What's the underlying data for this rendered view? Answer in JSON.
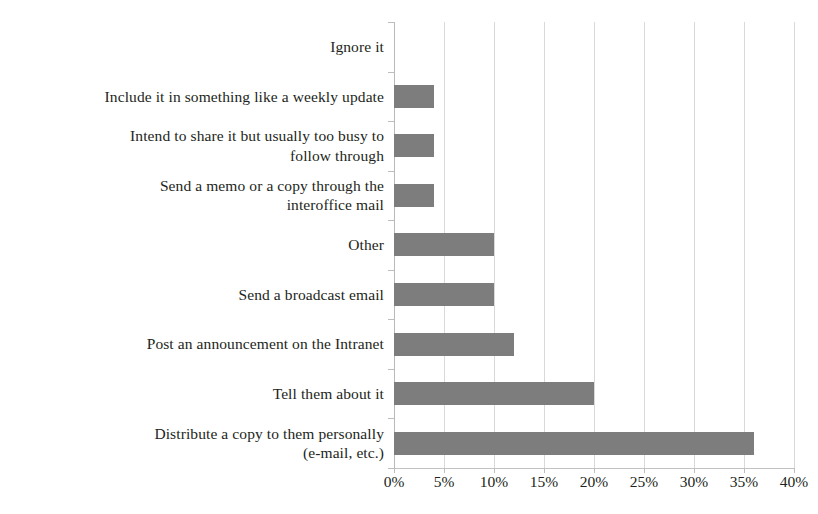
{
  "chart_data": {
    "type": "bar",
    "orientation": "horizontal",
    "title": "",
    "subtitle": "",
    "xlabel": "",
    "ylabel": "",
    "xlim": [
      0,
      40
    ],
    "xtick_step": 5,
    "xticks": [
      0,
      5,
      10,
      15,
      20,
      25,
      30,
      35,
      40
    ],
    "xtick_labels": [
      "0%",
      "5%",
      "10%",
      "15%",
      "20%",
      "25%",
      "30%",
      "35%",
      "40%"
    ],
    "grid": "vertical",
    "legend": "none",
    "value_unit": "%",
    "bar_color": "#7d7d7d",
    "gridline_color": "#d9d9d9",
    "axis_color": "#bdbdbd",
    "text_color": "#231f20",
    "categories": [
      "Ignore it",
      "Include it in something like a weekly update",
      "Intend to share it but usually too busy to follow through",
      "Send a memo or a copy through the interoffice mail",
      "Other",
      "Send a broadcast email",
      "Post an announcement on the Intranet",
      "Tell them about it",
      "Distribute a copy to them personally (e-mail, etc.)"
    ],
    "category_lines": [
      [
        "Ignore it"
      ],
      [
        "Include it in something like a weekly update"
      ],
      [
        "Intend to share it but usually too busy to",
        "follow through"
      ],
      [
        "Send a memo or a copy through the",
        "interoffice mail"
      ],
      [
        "Other"
      ],
      [
        "Send a broadcast email"
      ],
      [
        "Post an announcement on the Intranet"
      ],
      [
        "Tell them about it"
      ],
      [
        "Distribute a copy to them personally",
        "(e-mail, etc.)"
      ]
    ],
    "values": [
      0,
      4,
      4,
      4,
      10,
      10,
      12,
      20,
      36
    ],
    "value_labels": [
      "0%",
      "4%",
      "4%",
      "4%",
      "10%",
      "10%",
      "12%",
      "20%",
      "36%"
    ]
  }
}
